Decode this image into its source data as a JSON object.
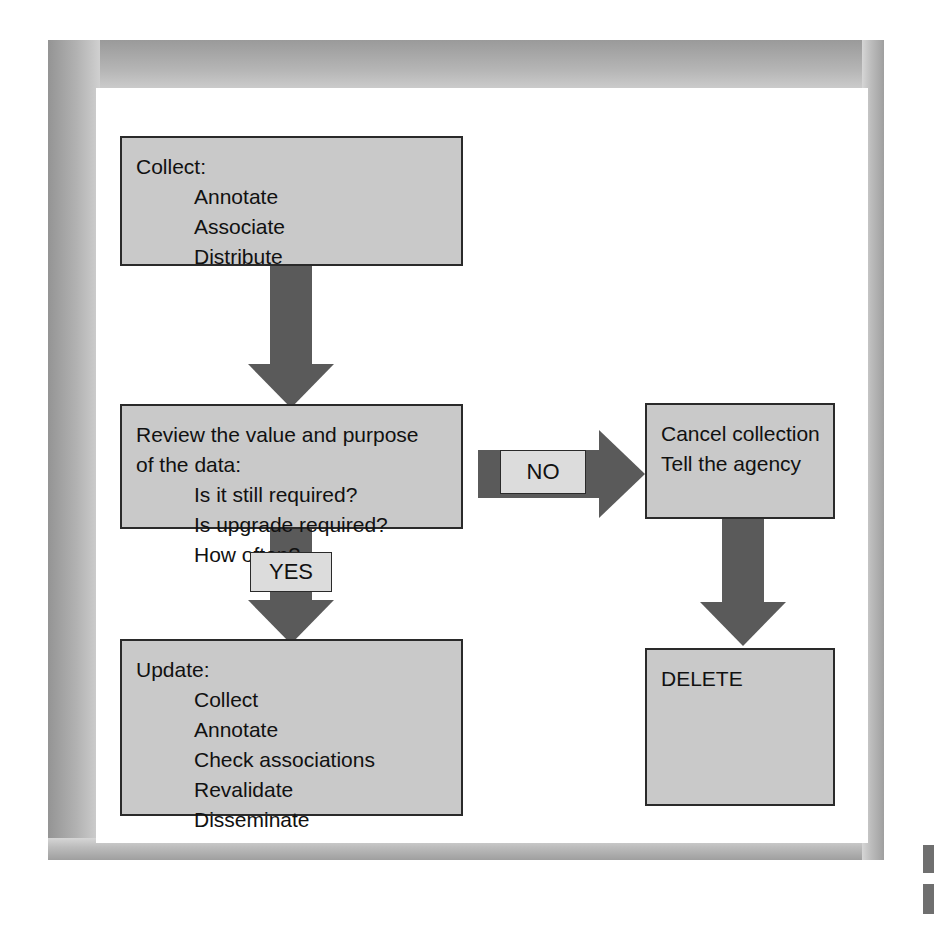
{
  "diagram": {
    "colors": {
      "node_fill": "#c9c9c9",
      "node_border": "#2a2a2a",
      "arrow_fill": "#5a5a5a",
      "label_fill": "#dcdcdc",
      "page_background": "#ffffff",
      "frame_gray": "#b2b2b2"
    },
    "nodes": {
      "collect": {
        "name": "Collect",
        "lines": [
          {
            "text": "Collect:",
            "indent": false
          },
          {
            "text": "Annotate",
            "indent": true
          },
          {
            "text": "Associate",
            "indent": true
          },
          {
            "text": "Distribute",
            "indent": true
          }
        ]
      },
      "review": {
        "name": "Review",
        "lines": [
          {
            "text": "Review the value and purpose",
            "indent": false
          },
          {
            "text": "of the data:",
            "indent": false
          },
          {
            "text": "Is it still required?",
            "indent": true
          },
          {
            "text": "Is upgrade required?",
            "indent": true
          },
          {
            "text": "How often?",
            "indent": true
          }
        ]
      },
      "update": {
        "name": "Update",
        "lines": [
          {
            "text": "Update:",
            "indent": false
          },
          {
            "text": "Collect",
            "indent": true
          },
          {
            "text": "Annotate",
            "indent": true
          },
          {
            "text": "Check associations",
            "indent": true
          },
          {
            "text": "Revalidate",
            "indent": true
          },
          {
            "text": "Disseminate",
            "indent": true
          }
        ]
      },
      "cancel": {
        "name": "Cancel collection",
        "lines": [
          {
            "text": "Cancel collection",
            "indent": false
          },
          {
            "text": "Tell the agency",
            "indent": false
          }
        ]
      },
      "delete": {
        "name": "Delete",
        "lines": [
          {
            "text": "DELETE",
            "indent": false
          }
        ]
      }
    },
    "branches": {
      "yes_label": "YES",
      "no_label": "NO"
    }
  }
}
